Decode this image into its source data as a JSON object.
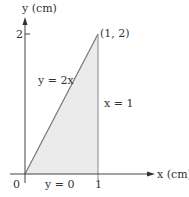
{
  "diagram": {
    "y_axis_label": "y (cm)",
    "x_axis_label": "x (cm)",
    "y_tick": "2",
    "x_tick": "1",
    "origin": "0",
    "point_label": "(1, 2)",
    "curves": {
      "diagonal": "y = 2x",
      "vertical": "x = 1",
      "bottom": "y = 0"
    },
    "colors": {
      "fill": "#ebebeb",
      "line": "#777777",
      "axis": "#444444"
    }
  }
}
